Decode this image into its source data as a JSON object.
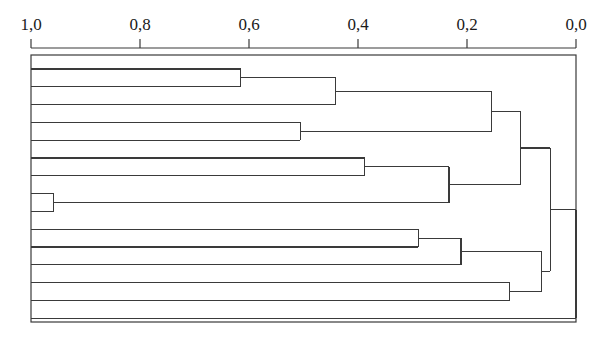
{
  "chart_data": {
    "type": "dendrogram",
    "title": "",
    "xlabel": "",
    "ylabel": "",
    "orientation": "horizontal",
    "axis_position": "top",
    "axis_direction": "reversed",
    "xlim": [
      1.0,
      0.0
    ],
    "grid": false,
    "legend": null,
    "tick_labels": [
      "1,0",
      "0,8",
      "0,6",
      "0,4",
      "0,2",
      "0,0"
    ],
    "tick_values": [
      1.0,
      0.8,
      0.6,
      0.4,
      0.2,
      0.0
    ],
    "leaf_count": 15,
    "leaf_labels": [
      "",
      "",
      "",
      "",
      "",
      "",
      "",
      "",
      "",
      "",
      "",
      "",
      "",
      "",
      ""
    ],
    "leaf_start_value": 1.0,
    "merges": [
      {
        "id": "m1",
        "children": [
          "leaf1",
          "leaf2"
        ],
        "value": 0.615
      },
      {
        "id": "m2",
        "children": [
          "m1",
          "leaf3"
        ],
        "value": 0.441
      },
      {
        "id": "m3",
        "children": [
          "leaf4",
          "leaf5"
        ],
        "value": 0.506
      },
      {
        "id": "m4",
        "children": [
          "m2",
          "m3"
        ],
        "value": 0.155
      },
      {
        "id": "m5",
        "children": [
          "leaf6",
          "leaf7"
        ],
        "value": 0.388
      },
      {
        "id": "m6",
        "children": [
          "leaf8",
          "leaf9"
        ],
        "value": 0.958
      },
      {
        "id": "m7",
        "children": [
          "m5",
          "m6"
        ],
        "value": 0.233
      },
      {
        "id": "m8",
        "children": [
          "m4",
          "m7"
        ],
        "value": 0.102
      },
      {
        "id": "m9",
        "children": [
          "leaf10",
          "leaf11"
        ],
        "value": 0.289
      },
      {
        "id": "m10",
        "children": [
          "m9",
          "leaf12"
        ],
        "value": 0.211
      },
      {
        "id": "m11",
        "children": [
          "leaf13",
          "leaf14"
        ],
        "value": 0.122
      },
      {
        "id": "m12",
        "children": [
          "m10",
          "m11"
        ],
        "value": 0.064
      },
      {
        "id": "m13",
        "children": [
          "m8",
          "m12"
        ],
        "value": 0.047
      },
      {
        "id": "root",
        "children": [
          "m13",
          "leaf15"
        ],
        "value": 0.0
      }
    ],
    "line_color": "#3a3a3a",
    "background_color": "#ffffff"
  },
  "geometry": {
    "plot_left_x": 31,
    "plot_right_x": 576,
    "axis_y": 48,
    "plot_top_y": 55,
    "plot_bottom_y": 322,
    "leaf_spacing": 17.8,
    "first_leaf_y": 69,
    "tick_length": 9,
    "label_y": 30
  },
  "figure": {
    "width": 601,
    "height": 337
  }
}
